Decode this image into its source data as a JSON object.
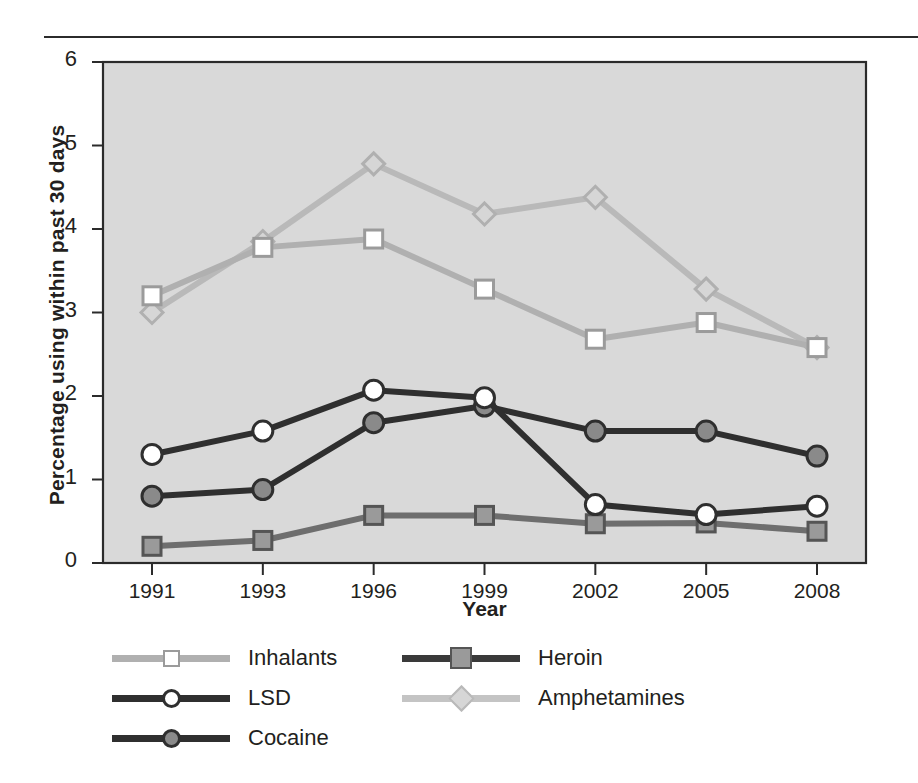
{
  "chart_data": {
    "type": "line",
    "title": "",
    "xlabel": "Year",
    "ylabel": "Percentage using within past 30 days",
    "categories": [
      "1991",
      "1993",
      "1996",
      "1999",
      "2002",
      "2005",
      "2008"
    ],
    "x": [
      1991,
      1993,
      1996,
      1999,
      2002,
      2005,
      2008
    ],
    "ylim": [
      0,
      6
    ],
    "yticks": [
      "0",
      "1",
      "2",
      "3",
      "4",
      "5",
      "6"
    ],
    "ytick_values": [
      0,
      1,
      2,
      3,
      4,
      5,
      6
    ],
    "grid": false,
    "legend_position": "below-axes",
    "plot_background": "#d9d9d9",
    "series": [
      {
        "name": "Inhalants",
        "marker": "open-square",
        "line_color": "#b0b0b0",
        "marker_fill": "#ffffff",
        "marker_edge": "#9b9b9b",
        "values": [
          3.2,
          3.78,
          3.88,
          3.28,
          2.68,
          2.88,
          2.58
        ]
      },
      {
        "name": "LSD",
        "marker": "open-circle",
        "line_color": "#2f2f2f",
        "marker_fill": "#ffffff",
        "marker_edge": "#2f2f2f",
        "values": [
          1.3,
          1.58,
          2.07,
          1.98,
          0.7,
          0.58,
          0.68
        ]
      },
      {
        "name": "Cocaine",
        "marker": "filled-circle",
        "line_color": "#2f2f2f",
        "marker_fill": "#8a8a8a",
        "marker_edge": "#2f2f2f",
        "values": [
          0.8,
          0.88,
          1.68,
          1.88,
          1.58,
          1.58,
          1.28
        ]
      },
      {
        "name": "Heroin",
        "marker": "filled-square",
        "line_color": "#6e6e6e",
        "marker_fill": "#9a9a9a",
        "marker_edge": "#555555",
        "values": [
          0.2,
          0.27,
          0.57,
          0.57,
          0.47,
          0.48,
          0.38
        ]
      },
      {
        "name": "Amphetamines",
        "marker": "filled-diamond",
        "line_color": "#b9b9b9",
        "marker_fill": "#d6d6d6",
        "marker_edge": "#b0b0b0",
        "values": [
          3.0,
          3.85,
          4.78,
          4.18,
          4.38,
          3.28,
          2.58
        ]
      }
    ]
  },
  "axes": {
    "ylabel": "Percentage using within past 30 days",
    "xlabel": "Year"
  },
  "legend": {
    "columns": [
      {
        "entries": [
          "Inhalants",
          "LSD",
          "Cocaine"
        ]
      },
      {
        "entries": [
          "Heroin",
          "Amphetamines"
        ]
      }
    ],
    "items": [
      {
        "label": "Inhalants",
        "marker": "open-square"
      },
      {
        "label": "LSD",
        "marker": "open-circle"
      },
      {
        "label": "Cocaine",
        "marker": "filled-circle"
      },
      {
        "label": "Heroin",
        "marker": "filled-square"
      },
      {
        "label": "Amphetamines",
        "marker": "filled-diamond"
      }
    ]
  },
  "colors": {
    "plot_bg": "#d9d9d9",
    "axis": "#2b2b2b",
    "text": "#231f20",
    "light_line": "#b0b0b0",
    "dark_line": "#2f2f2f",
    "mid_line": "#6e6e6e"
  }
}
